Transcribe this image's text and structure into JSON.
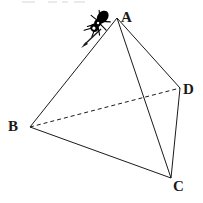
{
  "figure": {
    "background_color": "#ffffff",
    "stroke_color": "#1a1a1a",
    "width": 203,
    "height": 203,
    "vertices": [
      {
        "name": "A",
        "label": "A",
        "x": 117,
        "y": 18,
        "label_x": 121,
        "label_y": 10
      },
      {
        "name": "B",
        "label": "B",
        "x": 30,
        "y": 127,
        "label_x": 8,
        "label_y": 119
      },
      {
        "name": "C",
        "label": "C",
        "x": 171,
        "y": 178,
        "label_x": 173,
        "label_y": 179
      },
      {
        "name": "D",
        "label": "D",
        "x": 180,
        "y": 88,
        "label_x": 183,
        "label_y": 82
      }
    ],
    "edges": [
      {
        "name": "edge-AB",
        "from": "A",
        "to": "B",
        "style": "solid",
        "hidden": false
      },
      {
        "name": "edge-AC",
        "from": "A",
        "to": "C",
        "style": "solid",
        "hidden": false
      },
      {
        "name": "edge-AD",
        "from": "A",
        "to": "D",
        "style": "solid",
        "hidden": false
      },
      {
        "name": "edge-BC",
        "from": "B",
        "to": "C",
        "style": "solid",
        "hidden": false
      },
      {
        "name": "edge-CD",
        "from": "C",
        "to": "D",
        "style": "solid",
        "hidden": false
      },
      {
        "name": "edge-BD",
        "from": "B",
        "to": "D",
        "style": "dashed",
        "hidden": true
      }
    ],
    "annotations": {
      "ant": {
        "icon": "ant-icon",
        "on_edge": "AB",
        "x": 97,
        "y": 24,
        "facing": "down-left",
        "color": "#000000"
      },
      "direction_arrow": {
        "icon": "arrow-icon",
        "along_edge": "AB",
        "from_x": 101,
        "from_y": 30,
        "to_x": 82,
        "to_y": 47,
        "color": "#1a1a1a"
      }
    },
    "top_crop_artifacts": [
      {
        "name": "artifact-1",
        "x": 22,
        "width": 13
      },
      {
        "name": "artifact-2",
        "x": 48,
        "width": 9
      },
      {
        "name": "artifact-3",
        "x": 62,
        "width": 6
      },
      {
        "name": "artifact-4",
        "x": 74,
        "width": 11
      }
    ]
  }
}
